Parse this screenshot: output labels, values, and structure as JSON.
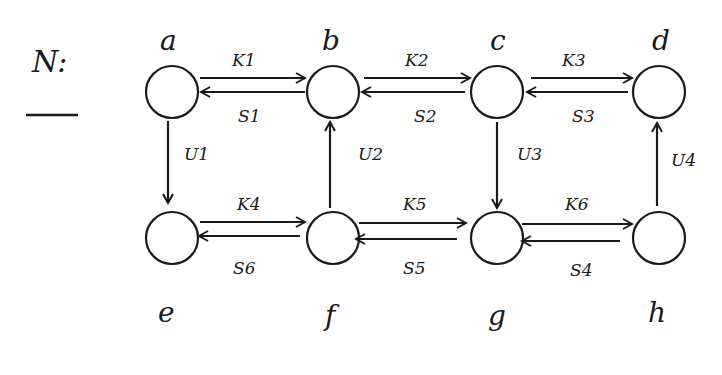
{
  "title": "N:",
  "colors": {
    "ink": "#1a1a1a",
    "background": "#ffffff"
  },
  "nodes": [
    {
      "id": "a",
      "label": "a",
      "x": 172,
      "y": 92,
      "lx": 172,
      "ly": 50
    },
    {
      "id": "b",
      "label": "b",
      "x": 333,
      "y": 92,
      "lx": 333,
      "ly": 50
    },
    {
      "id": "c",
      "label": "c",
      "x": 497,
      "y": 92,
      "lx": 503,
      "ly": 50
    },
    {
      "id": "d",
      "label": "d",
      "x": 659,
      "y": 92,
      "lx": 665,
      "ly": 50
    },
    {
      "id": "e",
      "label": "e",
      "x": 172,
      "y": 238,
      "lx": 170,
      "ly": 322
    },
    {
      "id": "f",
      "label": "f",
      "x": 333,
      "y": 238,
      "lx": 333,
      "ly": 328
    },
    {
      "id": "g",
      "label": "g",
      "x": 497,
      "y": 238,
      "lx": 497,
      "ly": 328
    },
    {
      "id": "h",
      "label": "h",
      "x": 659,
      "y": 238,
      "lx": 659,
      "ly": 322
    }
  ],
  "edges": [
    {
      "label": "K1",
      "from": "a",
      "to": "b"
    },
    {
      "label": "S1",
      "from": "b",
      "to": "a"
    },
    {
      "label": "K2",
      "from": "b",
      "to": "c"
    },
    {
      "label": "S2",
      "from": "c",
      "to": "b"
    },
    {
      "label": "K3",
      "from": "c",
      "to": "d"
    },
    {
      "label": "S3",
      "from": "d",
      "to": "c"
    },
    {
      "label": "U1",
      "from": "a",
      "to": "e"
    },
    {
      "label": "U2",
      "from": "f",
      "to": "b"
    },
    {
      "label": "U3",
      "from": "c",
      "to": "g"
    },
    {
      "label": "U4",
      "from": "h",
      "to": "d"
    },
    {
      "label": "K4",
      "from": "e",
      "to": "f"
    },
    {
      "label": "S6",
      "from": "f",
      "to": "e"
    },
    {
      "label": "K5",
      "from": "f",
      "to": "g"
    },
    {
      "label": "S5",
      "from": "g",
      "to": "f"
    },
    {
      "label": "K6",
      "from": "g",
      "to": "h"
    },
    {
      "label": "S4",
      "from": "h",
      "to": "g"
    }
  ],
  "edge_labels": {
    "k1": "Kₙ",
    "k1_text": "K1"
  },
  "labels": {
    "k1": "K1",
    "s1": "S1",
    "k2": "K2",
    "s2": "S2",
    "k3": "K3",
    "s3": "S3",
    "u1": "U1",
    "u2": "U2",
    "u3": "U3",
    "u4": "U4",
    "k4": "K4",
    "s6": "S6",
    "k5": "K5",
    "s5": "S5",
    "k6": "K6",
    "s4": "S4"
  }
}
